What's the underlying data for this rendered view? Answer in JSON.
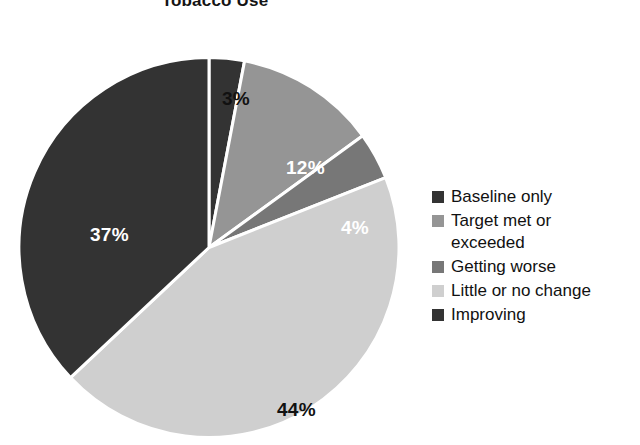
{
  "chart_data": {
    "type": "pie",
    "title": "Tobacco Use",
    "categories": [
      "Baseline only",
      "Target met or exceeded",
      "Getting worse",
      "Little or no change",
      "Improving"
    ],
    "values": [
      3,
      12,
      4,
      44,
      37
    ],
    "value_labels": [
      "3%",
      "12%",
      "4%",
      "44%",
      "37%"
    ],
    "value_label_colors": [
      "#111111",
      "#ffffff",
      "#ffffff",
      "#111111",
      "#ffffff"
    ],
    "slice_colors": [
      "#333333",
      "#959595",
      "#777777",
      "#cfcfcf",
      "#333333"
    ],
    "start_angle_deg": 0,
    "direction": "clockwise",
    "separator_color": "#ffffff",
    "legend_position": "right",
    "xlabel": "",
    "ylabel": ""
  },
  "legend": {
    "items": [
      {
        "label": "Baseline only",
        "color": "#333333"
      },
      {
        "label": "Target met or\nexceeded",
        "color": "#959595"
      },
      {
        "label": "Getting worse",
        "color": "#777777"
      },
      {
        "label": "Little or no change",
        "color": "#cfcfcf"
      },
      {
        "label": "Improving",
        "color": "#333333"
      }
    ]
  }
}
